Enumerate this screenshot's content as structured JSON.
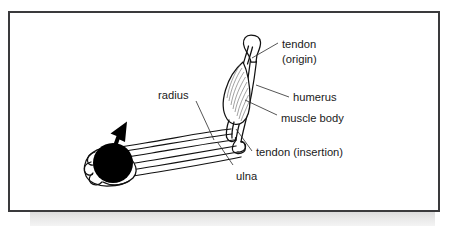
{
  "figure": {
    "kind": "anatomical-diagram",
    "frame_border_color": "#3a3a3c",
    "background_color": "#ffffff",
    "ink_color": "#111111",
    "shadow_color": "#e4e4e4"
  },
  "labels": [
    {
      "id": "tendon-origin",
      "line1": "tendon",
      "line2": "(origin)"
    },
    {
      "id": "humerus",
      "text": "humerus"
    },
    {
      "id": "muscle-body",
      "text": "muscle body"
    },
    {
      "id": "tendon-insertion",
      "text": "tendon (insertion)"
    },
    {
      "id": "ulna",
      "text": "ulna"
    },
    {
      "id": "radius",
      "text": "radius"
    }
  ],
  "elements": {
    "weight": "black-ball-weight",
    "hand": "hand-gripping-weight",
    "arrow": "upward-motion-arrow",
    "muscle": "striated-muscle-body",
    "humerus_bone": "upper-arm-bone",
    "radius_bone": "forearm-bone-radius",
    "ulna_bone": "forearm-bone-ulna"
  }
}
